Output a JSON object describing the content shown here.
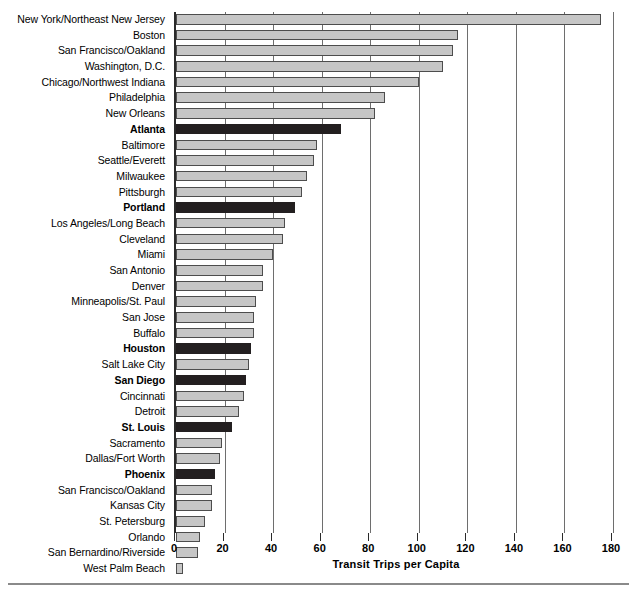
{
  "chart_data": {
    "type": "bar",
    "orientation": "horizontal",
    "title": "",
    "xlabel": "Transit Trips per Capita",
    "ylabel": "",
    "xlim": [
      0,
      180
    ],
    "xticks": [
      0,
      20,
      40,
      60,
      80,
      100,
      120,
      140,
      160,
      180
    ],
    "grid": true,
    "legend": null,
    "colors": {
      "bar_default": "#c6c6c6",
      "bar_highlight": "#231f20",
      "bar_border": "#4d4d4d",
      "gridline": "#6e6e6e",
      "axis": "#2a2a2a"
    },
    "categories": [
      "New York/Northeast New Jersey",
      "Boston",
      "San Francisco/Oakland",
      "Washington, D.C.",
      "Chicago/Northwest Indiana",
      "Philadelphia",
      "New Orleans",
      "Atlanta",
      "Baltimore",
      "Seattle/Everett",
      "Milwaukee",
      "Pittsburgh",
      "Portland",
      "Los Angeles/Long Beach",
      "Cleveland",
      "Miami",
      "San Antonio",
      "Denver",
      "Minneapolis/St. Paul",
      "San Jose",
      "Buffalo",
      "Houston",
      "Salt Lake City",
      "San Diego",
      "Cincinnati",
      "Detroit",
      "St. Louis",
      "Sacramento",
      "Dallas/Fort Worth",
      "Phoenix",
      "San Francisco/Oakland",
      "Kansas City",
      "St. Petersburg",
      "Orlando",
      "San Bernardino/Riverside",
      "West Palm Beach"
    ],
    "values": [
      175,
      116,
      114,
      110,
      100,
      86,
      82,
      68,
      58,
      57,
      54,
      52,
      49,
      45,
      44,
      40,
      36,
      36,
      33,
      32,
      32,
      31,
      30,
      29,
      28,
      26,
      23,
      19,
      18,
      16,
      15,
      15,
      12,
      10,
      9,
      3
    ],
    "highlighted": [
      "Atlanta",
      "Portland",
      "Houston",
      "San Diego",
      "St. Louis",
      "Phoenix"
    ]
  }
}
